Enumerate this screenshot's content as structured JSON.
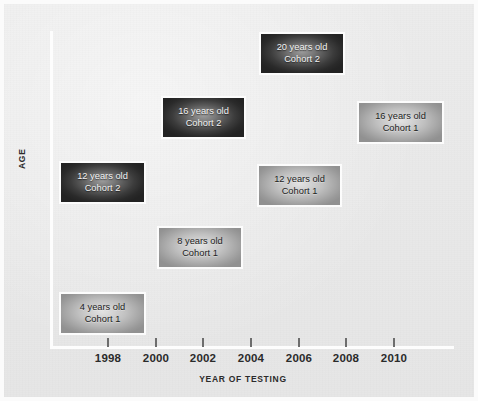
{
  "chart_data": {
    "type": "scatter",
    "title": "",
    "subtitle": "",
    "xlabel": "YEAR OF TESTING",
    "ylabel": "AGE",
    "grid": false,
    "legend": "none",
    "xlim": [
      1996.2,
      2011.8
    ],
    "ylim": [
      2,
      22
    ],
    "xticks": [
      "1998",
      "2000",
      "2002",
      "2004",
      "2006",
      "2008",
      "2010"
    ],
    "xtick_values": [
      1998,
      2000,
      2002,
      2004,
      2006,
      2008,
      2010
    ],
    "yticks": [],
    "series": [
      {
        "name": "Cohort 1",
        "style": "light",
        "points": [
          {
            "year": 1998,
            "age": 4,
            "age_label": "4 years old",
            "cohort_label": "Cohort 1"
          },
          {
            "year": 2002,
            "age": 8,
            "age_label": "8 years old",
            "cohort_label": "Cohort 1"
          },
          {
            "year": 2006,
            "age": 12,
            "age_label": "12 years old",
            "cohort_label": "Cohort 1"
          },
          {
            "year": 2010,
            "age": 16,
            "age_label": "16 years old",
            "cohort_label": "Cohort 1"
          }
        ]
      },
      {
        "name": "Cohort 2",
        "style": "dark",
        "points": [
          {
            "year": 1998,
            "age": 12,
            "age_label": "12 years old",
            "cohort_label": "Cohort 2"
          },
          {
            "year": 2002,
            "age": 16,
            "age_label": "16 years old",
            "cohort_label": "Cohort 2"
          },
          {
            "year": 2006,
            "age": 20,
            "age_label": "20 years old",
            "cohort_label": "Cohort 2"
          }
        ]
      }
    ]
  },
  "axes": {
    "x_label": "YEAR OF TESTING",
    "y_label": "AGE",
    "ticks": [
      {
        "label": "1998",
        "x": 103
      },
      {
        "label": "2000",
        "x": 151
      },
      {
        "label": "2002",
        "x": 198
      },
      {
        "label": "2004",
        "x": 246
      },
      {
        "label": "2006",
        "x": 294
      },
      {
        "label": "2008",
        "x": 341
      },
      {
        "label": "2010",
        "x": 389
      }
    ]
  },
  "cells": [
    {
      "id": "cell-20-cohort2",
      "age_label": "20 years old",
      "cohort_label": "Cohort 2",
      "style": "dark",
      "left": 255,
      "top": 28,
      "width": 86,
      "height": 43
    },
    {
      "id": "cell-16-cohort2",
      "age_label": "16 years old",
      "cohort_label": "Cohort 2",
      "style": "dark",
      "left": 157,
      "top": 92,
      "width": 85,
      "height": 43
    },
    {
      "id": "cell-16-cohort1",
      "age_label": "16 years old",
      "cohort_label": "Cohort 1",
      "style": "light",
      "left": 353,
      "top": 97,
      "width": 87,
      "height": 43
    },
    {
      "id": "cell-12-cohort2",
      "age_label": "12 years old",
      "cohort_label": "Cohort 2",
      "style": "dark",
      "left": 55,
      "top": 157,
      "width": 87,
      "height": 43
    },
    {
      "id": "cell-12-cohort1",
      "age_label": "12 years old",
      "cohort_label": "Cohort 1",
      "style": "light",
      "left": 253,
      "top": 160,
      "width": 85,
      "height": 43
    },
    {
      "id": "cell-8-cohort1",
      "age_label": "8 years old",
      "cohort_label": "Cohort 1",
      "style": "light",
      "left": 153,
      "top": 222,
      "width": 86,
      "height": 43
    },
    {
      "id": "cell-4-cohort1",
      "age_label": "4 years old",
      "cohort_label": "Cohort 1",
      "style": "light",
      "left": 55,
      "top": 288,
      "width": 87,
      "height": 43
    }
  ],
  "colors": {
    "background": "#e9e9e9",
    "axis_line": "#fdfdfd",
    "tick_mark": "#6d6d6d",
    "text_dark": "#222222",
    "text_light": "#f2f2f2",
    "cohort2_fill_edge": "#232323",
    "cohort1_fill_edge": "#919191",
    "cell_border": "#fcfcfc"
  }
}
